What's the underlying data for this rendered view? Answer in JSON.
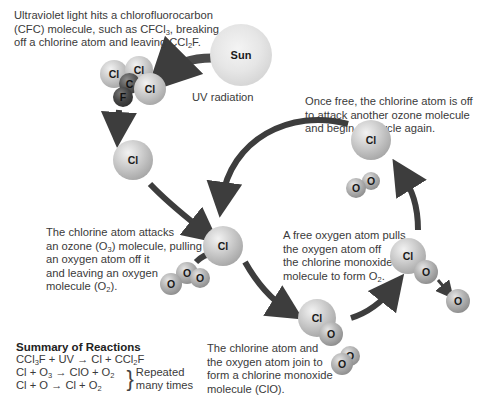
{
  "captions": {
    "uv_hits": [
      "Ultraviolet light hits a chlorofluorocarbon",
      "(CFC) molecule, such as CFCl3, breaking",
      "off a chlorine atom and leaving CCl2F."
    ],
    "once_free": [
      "Once free, the chlorine atom is off",
      "to attack another ozone molecule",
      "and begin the cycle again."
    ],
    "attacks": [
      "The chlorine atom attacks",
      "an ozone (O3) molecule, pulling",
      "an oxygen atom off it",
      "and leaving an oxygen",
      "molecule (O2)."
    ],
    "free_oxygen": [
      "A free oxygen atom pulls",
      "the oxygen atom off",
      "the chlorine monoxide",
      "molecule to form O2."
    ],
    "join": [
      "The chlorine atom and",
      "the oxygen atom join to",
      "form a chlorine monoxide",
      "molecule (ClO)."
    ],
    "uv_radiation": "UV radiation"
  },
  "atoms": {
    "sun": "Sun",
    "cl": "Cl",
    "c": "C",
    "f": "F",
    "o": "O"
  },
  "summary": {
    "title": "Summary of Reactions",
    "eq1": "CCl3F + UV → Cl + CCl2F",
    "eq2": "Cl + O3 → ClO + O2",
    "eq3": "Cl + O → Cl + O2",
    "repeated": [
      "Repeated",
      "many times"
    ]
  },
  "colors": {
    "arrow": "#3d3d3d",
    "text": "#3a3a3a"
  }
}
